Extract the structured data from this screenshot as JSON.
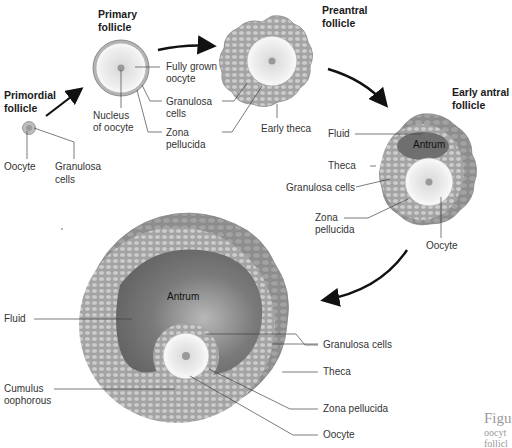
{
  "stages": {
    "primordial": {
      "title_line1": "Primordial",
      "title_line2": "follicle",
      "labels": {
        "oocyte": "Oocyte",
        "granulosa_line1": "Granulosa",
        "granulosa_line2": "cells"
      }
    },
    "primary": {
      "title_line1": "Primary",
      "title_line2": "follicle",
      "labels": {
        "fully_grown_line1": "Fully grown",
        "fully_grown_line2": "oocyte",
        "nucleus_line1": "Nucleus",
        "nucleus_line2": "of oocyte",
        "granulosa_line1": "Granulosa",
        "granulosa_line2": "cells",
        "zona_line1": "Zona",
        "zona_line2": "pellucida"
      }
    },
    "preantral": {
      "title_line1": "Preantral",
      "title_line2": "follicle",
      "labels": {
        "early_theca": "Early theca"
      }
    },
    "early_antral": {
      "title_line1": "Early antral",
      "title_line2": "follicle",
      "labels": {
        "fluid": "Fluid",
        "antrum": "Antrum",
        "theca": "Theca",
        "granulosa": "Granulosa cells",
        "zona_line1": "Zona",
        "zona_line2": "pellucida",
        "oocyte": "Oocyte"
      }
    },
    "mature": {
      "labels": {
        "antrum": "Antrum",
        "fluid": "Fluid",
        "cumulus_line1": "Cumulus",
        "cumulus_line2": "oophorous",
        "granulosa": "Granulosa cells",
        "theca": "Theca",
        "zona": "Zona pellucida",
        "oocyte": "Oocyte"
      }
    }
  },
  "caption": {
    "line1": "Figu",
    "line2": "oocyt",
    "line3": "follicl"
  },
  "colors": {
    "theca": "#8f8f8f",
    "granulosa": "#a9a9a9",
    "cell": "#cfcfcf",
    "antrum": "#6e6e6e",
    "zona": "#f4f4f4",
    "oocyte": "#e6e6e6",
    "nucleus": "#9a9a9a",
    "arrow": "#111111",
    "leader": "#444444"
  }
}
